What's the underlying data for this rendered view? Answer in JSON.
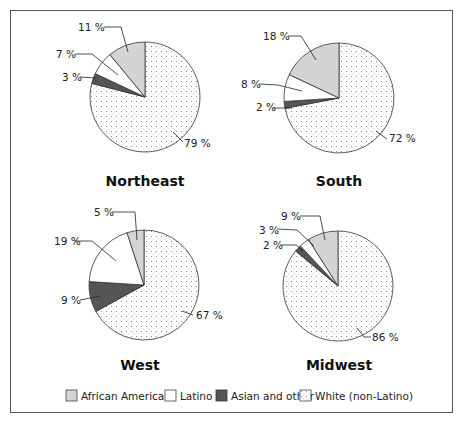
{
  "chart_data": {
    "type": "pie",
    "legend": {
      "position": "bottom",
      "entries": [
        {
          "name": "African American",
          "color": "#d4d4d4",
          "pattern": "solid"
        },
        {
          "name": "Latino",
          "color": "#ffffff",
          "pattern": "solid"
        },
        {
          "name": "Asian and other",
          "color": "#555555",
          "pattern": "solid"
        },
        {
          "name": "White (non-Latino)",
          "color": "#ffffff",
          "pattern": "dotted"
        }
      ]
    },
    "charts": [
      {
        "title": "Northeast",
        "slices": [
          {
            "name": "White (non-Latino)",
            "value": 79,
            "label": "79 %"
          },
          {
            "name": "Asian and other",
            "value": 3,
            "label": "3 %"
          },
          {
            "name": "Latino",
            "value": 7,
            "label": "7 %"
          },
          {
            "name": "African American",
            "value": 11,
            "label": "11 %"
          }
        ]
      },
      {
        "title": "South",
        "slices": [
          {
            "name": "White (non-Latino)",
            "value": 72,
            "label": "72 %"
          },
          {
            "name": "Asian and other",
            "value": 2,
            "label": "2 %"
          },
          {
            "name": "Latino",
            "value": 8,
            "label": "8 %"
          },
          {
            "name": "African American",
            "value": 18,
            "label": "18 %"
          }
        ]
      },
      {
        "title": "West",
        "slices": [
          {
            "name": "White (non-Latino)",
            "value": 67,
            "label": "67 %"
          },
          {
            "name": "Asian and other",
            "value": 9,
            "label": "9 %"
          },
          {
            "name": "Latino",
            "value": 19,
            "label": "19 %"
          },
          {
            "name": "African American",
            "value": 5,
            "label": "5 %"
          }
        ]
      },
      {
        "title": "Midwest",
        "slices": [
          {
            "name": "White (non-Latino)",
            "value": 86,
            "label": "86 %"
          },
          {
            "name": "Asian and other",
            "value": 2,
            "label": "2 %"
          },
          {
            "name": "Latino",
            "value": 3,
            "label": "3 %"
          },
          {
            "name": "African American",
            "value": 9,
            "label": "9 %"
          }
        ]
      }
    ]
  },
  "titles": {
    "northeast": "Northeast",
    "south": "South",
    "west": "West",
    "midwest": "Midwest"
  },
  "labels": {
    "northeast": {
      "white": "79 %",
      "asian": "3 %",
      "latino": "7 %",
      "african": "11 %"
    },
    "south": {
      "white": "72 %",
      "asian": "2 %",
      "latino": "8 %",
      "african": "18 %"
    },
    "west": {
      "white": "67 %",
      "asian": "9 %",
      "latino": "19 %",
      "african": "5 %"
    },
    "midwest": {
      "white": "86 %",
      "asian": "2 %",
      "latino": "3 %",
      "african": "9 %"
    }
  },
  "legend": {
    "african": "African American",
    "latino": "Latino",
    "asian": "Asian and other",
    "white": "White (non-Latino)"
  }
}
